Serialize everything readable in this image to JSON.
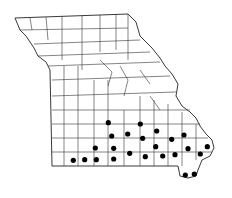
{
  "map": {
    "region": "Missouri",
    "subdivision": "counties",
    "colors": {
      "background": "#ffffff",
      "line": "#222222",
      "dot": "#000000"
    },
    "dots": [
      [
        108.3,
        122.7
      ],
      [
        111.7,
        136
      ],
      [
        127.7,
        134
      ],
      [
        140.3,
        124
      ],
      [
        142.7,
        138.3
      ],
      [
        156.7,
        131
      ],
      [
        155.7,
        146.7
      ],
      [
        171.7,
        139.3
      ],
      [
        184,
        135
      ],
      [
        188,
        148.7
      ],
      [
        207.3,
        146.7
      ],
      [
        200.3,
        154
      ],
      [
        175,
        154.7
      ],
      [
        162.7,
        156
      ],
      [
        145.3,
        156.7
      ],
      [
        129.7,
        153.3
      ],
      [
        113.7,
        148.3
      ],
      [
        113.7,
        159
      ],
      [
        96.3,
        159.7
      ],
      [
        95.3,
        148
      ],
      [
        84.7,
        159.7
      ],
      [
        73.3,
        160.3
      ],
      [
        185.3,
        175
      ],
      [
        194.3,
        174
      ]
    ]
  }
}
